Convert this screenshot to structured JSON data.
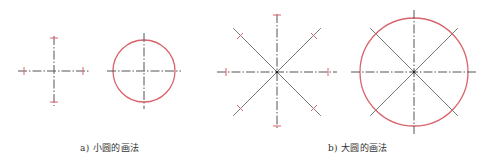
{
  "colors": {
    "centerline": "#555555",
    "construction": "#777777",
    "circle": "#d9646c",
    "tick": "#d9646c",
    "caption": "#333333"
  },
  "panels": [
    {
      "id": "a",
      "caption": "a) 小圆的画法",
      "caption_x": 80,
      "figures": [
        {
          "kind": "cross-with-ticks",
          "cx": 54,
          "cy": 71,
          "h_half": 36,
          "v_half": 35,
          "ticks": [
            [
              24,
              71,
              "v"
            ],
            [
              83,
              71,
              "v"
            ],
            [
              54,
              38,
              "h"
            ],
            [
              54,
              102,
              "h"
            ]
          ]
        },
        {
          "kind": "circle-with-cross",
          "cx": 144,
          "cy": 71,
          "r": 31,
          "h_half": 37,
          "v_half": 38
        }
      ]
    },
    {
      "id": "b",
      "caption": "b) 大圆的画法",
      "caption_x": 328,
      "figures": [
        {
          "kind": "star-with-ticks",
          "cx": 277,
          "cy": 72,
          "h_half": 60,
          "v_half": 58,
          "d_half": 62,
          "ticks": [
            [
              226,
              72,
              "v"
            ],
            [
              328,
              72,
              "v"
            ],
            [
              277,
              15,
              "h"
            ],
            [
              277,
              126,
              "h"
            ],
            [
              240,
              36,
              "d"
            ],
            [
              314,
              36,
              "d2"
            ],
            [
              240,
              108,
              "d2"
            ],
            [
              314,
              108,
              "d"
            ]
          ]
        },
        {
          "kind": "circle-with-star",
          "cx": 414,
          "cy": 72,
          "r": 54,
          "h_half": 63,
          "v_half": 62,
          "d_half": 62
        }
      ]
    }
  ]
}
